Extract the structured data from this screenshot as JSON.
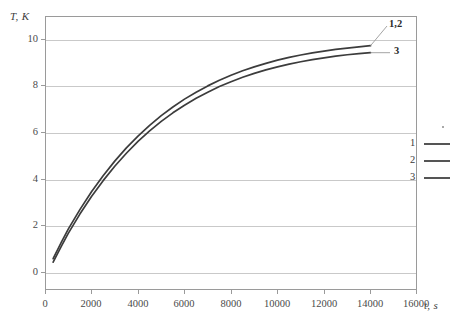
{
  "chart_data": {
    "type": "line",
    "title": "",
    "xlabel": "t, s",
    "ylabel": "T, K",
    "xlim": [
      0,
      16000
    ],
    "ylim": [
      0,
      11.8
    ],
    "grid": "horizontal",
    "xticks": [
      "0",
      "2000",
      "4000",
      "6000",
      "8000",
      "10000",
      "12000",
      "14000",
      "16000"
    ],
    "xtick_values": [
      0,
      2000,
      4000,
      6000,
      8000,
      10000,
      12000,
      14000,
      16000
    ],
    "yticks": [
      "0",
      "2",
      "4",
      "6",
      "8",
      "10"
    ],
    "ytick_values": [
      0,
      2,
      4,
      6,
      8,
      10
    ],
    "legend_position": "right",
    "legend": [
      {
        "key": "1",
        "color": "#555555"
      },
      {
        "key": "2",
        "color": "#555555"
      },
      {
        "key": "3",
        "color": "#555555"
      }
    ],
    "annotations": [
      {
        "text": "1,2",
        "target_series": "1,2"
      },
      {
        "text": "3",
        "target_series": "3"
      }
    ],
    "x": [
      350,
      700,
      1000,
      1500,
      2000,
      2500,
      3000,
      3500,
      4000,
      4500,
      5000,
      5500,
      6000,
      6500,
      7000,
      7500,
      8000,
      8500,
      9000,
      9500,
      10000,
      10500,
      11000,
      11500,
      12000,
      12500,
      13000,
      13500,
      14000
    ],
    "series": [
      {
        "name": "1,2",
        "color": "#3c3c3c",
        "values": [
          1.35,
          2.05,
          2.62,
          3.46,
          4.23,
          4.92,
          5.55,
          6.12,
          6.63,
          7.09,
          7.51,
          7.88,
          8.22,
          8.52,
          8.79,
          9.03,
          9.25,
          9.44,
          9.61,
          9.76,
          9.9,
          10.02,
          10.12,
          10.21,
          10.29,
          10.36,
          10.42,
          10.47,
          10.52
        ]
      },
      {
        "name": "3",
        "color": "#3c3c3c",
        "values": [
          1.2,
          1.88,
          2.44,
          3.27,
          4.03,
          4.71,
          5.33,
          5.89,
          6.4,
          6.85,
          7.26,
          7.63,
          7.96,
          8.26,
          8.52,
          8.76,
          8.97,
          9.16,
          9.33,
          9.48,
          9.61,
          9.73,
          9.83,
          9.92,
          10.0,
          10.07,
          10.13,
          10.18,
          10.22
        ]
      }
    ]
  }
}
